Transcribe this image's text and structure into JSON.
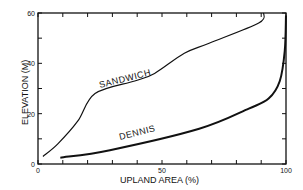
{
  "chart_data": {
    "type": "line",
    "title": "",
    "xlabel": "UPLAND AREA (%)",
    "ylabel": "ELEVATION (M)",
    "xlim": [
      0,
      100
    ],
    "ylim": [
      0,
      60
    ],
    "x_ticks": [
      "0",
      "50",
      "100"
    ],
    "y_ticks": [
      "0",
      "20",
      "40",
      "60"
    ],
    "grid": false,
    "legend": "inline labels",
    "series": [
      {
        "name": "SANDWICH",
        "x": [
          2,
          8,
          16,
          23,
          39,
          47,
          59,
          69,
          89,
          91
        ],
        "y": [
          3,
          8,
          17,
          28,
          33,
          36,
          44,
          48,
          56,
          60
        ]
      },
      {
        "name": "DENNIS",
        "x": [
          9,
          29,
          65,
          85,
          93,
          97.5,
          99.5,
          100
        ],
        "y": [
          2.5,
          5.5,
          14,
          22,
          26,
          33,
          45,
          59
        ]
      }
    ]
  }
}
